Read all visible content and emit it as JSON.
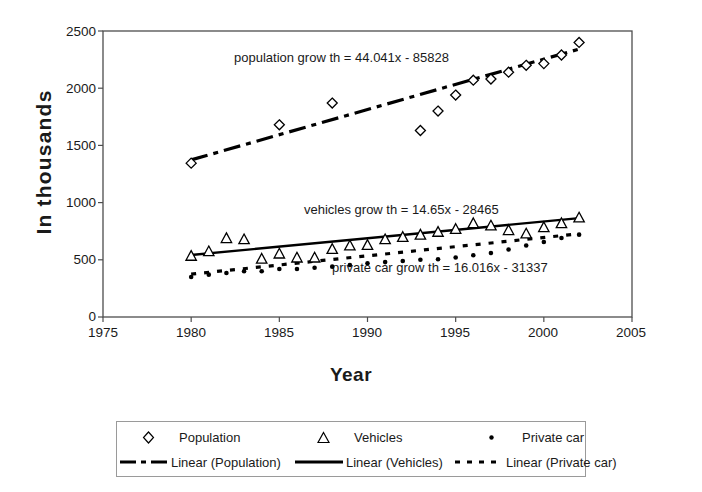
{
  "chart_data": {
    "type": "scatter",
    "title": "",
    "xlabel": "Year",
    "ylabel": "In thousands",
    "xlim": [
      1975,
      2005
    ],
    "ylim": [
      0,
      2500
    ],
    "grid": false,
    "legend_position": "bottom",
    "xticks": [
      "1975",
      "1980",
      "1985",
      "1990",
      "1995",
      "2000",
      "2005"
    ],
    "yticks": [
      "0",
      "500",
      "1000",
      "1500",
      "2000",
      "2500"
    ],
    "annotations": [
      {
        "id": "population-eq",
        "text": "population grow th = 44.041x - 85828"
      },
      {
        "id": "vehicles-eq",
        "text": "vehicles grow th = 14.65x - 28465"
      },
      {
        "id": "private-car-eq",
        "text": "private car grow th = 16.016x - 31337"
      }
    ],
    "x": [
      1980,
      1981,
      1982,
      1983,
      1984,
      1985,
      1986,
      1987,
      1988,
      1989,
      1990,
      1991,
      1992,
      1993,
      1994,
      1995,
      1996,
      1997,
      1998,
      1999,
      2000,
      2001,
      2002
    ],
    "series": [
      {
        "name": "Population",
        "marker": "diamond",
        "values": [
          1345,
          null,
          null,
          null,
          null,
          1680,
          null,
          null,
          1870,
          null,
          null,
          null,
          null,
          1630,
          1800,
          1940,
          2070,
          2080,
          2140,
          2200,
          2215,
          2290,
          2400
        ],
        "trend": {
          "name": "Linear (Population)",
          "slope": 44.041,
          "intercept": -85828,
          "style": "dash-dot"
        }
      },
      {
        "name": "Vehicles",
        "marker": "triangle",
        "values": [
          535,
          575,
          690,
          680,
          510,
          555,
          520,
          520,
          595,
          625,
          630,
          680,
          700,
          720,
          745,
          770,
          820,
          800,
          760,
          730,
          785,
          820,
          870
        ],
        "trend": {
          "name": "Linear (Vehicles)",
          "slope": 14.65,
          "intercept": -28465,
          "style": "solid"
        }
      },
      {
        "name": "Private car",
        "marker": "dot",
        "values": [
          350,
          370,
          385,
          400,
          400,
          420,
          420,
          430,
          440,
          455,
          470,
          480,
          490,
          500,
          505,
          520,
          540,
          560,
          590,
          625,
          655,
          690,
          720
        ],
        "trend": {
          "name": "Linear (Private car)",
          "slope": 16.016,
          "intercept": -31337,
          "style": "dotted"
        }
      }
    ]
  },
  "legend": {
    "row1": [
      {
        "key": "diamond-marker",
        "label": "Population"
      },
      {
        "key": "triangle-marker",
        "label": "Vehicles"
      },
      {
        "key": "dot-marker",
        "label": "Private car"
      }
    ],
    "row2": [
      {
        "key": "dash-dot-line",
        "label": "Linear (Population)"
      },
      {
        "key": "solid-line",
        "label": "Linear (Vehicles)"
      },
      {
        "key": "dotted-line",
        "label": "Linear (Private car)"
      }
    ]
  },
  "colors": {
    "ink": "#000000",
    "frame": "#4d4d4d",
    "background": "#ffffff"
  }
}
